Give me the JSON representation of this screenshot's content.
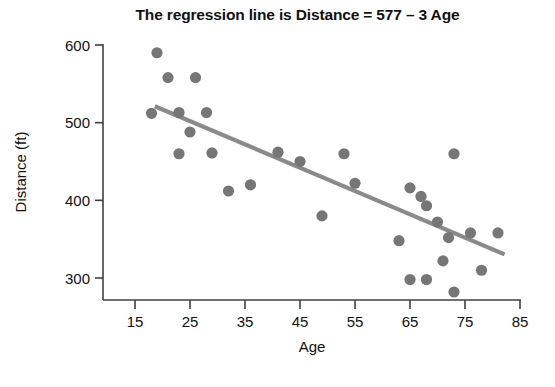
{
  "chart_data": {
    "type": "scatter",
    "title": "The regression line is Distance = 577 – 3 Age",
    "xlabel": "Age",
    "ylabel": "Distance (ft)",
    "xlim": [
      12,
      85
    ],
    "ylim": [
      270,
      610
    ],
    "xticks": [
      15,
      25,
      35,
      45,
      55,
      65,
      75,
      85
    ],
    "yticks": [
      300,
      400,
      500,
      600
    ],
    "grid": false,
    "legend": null,
    "point_color": "#767676",
    "line_color": "#8a8a8a",
    "axis_color": "#404040",
    "points": [
      {
        "x": 19,
        "y": 590
      },
      {
        "x": 21,
        "y": 558
      },
      {
        "x": 26,
        "y": 558
      },
      {
        "x": 18,
        "y": 512
      },
      {
        "x": 23,
        "y": 513
      },
      {
        "x": 28,
        "y": 513
      },
      {
        "x": 25,
        "y": 488
      },
      {
        "x": 23,
        "y": 460
      },
      {
        "x": 29,
        "y": 461
      },
      {
        "x": 32,
        "y": 412
      },
      {
        "x": 36,
        "y": 420
      },
      {
        "x": 41,
        "y": 462
      },
      {
        "x": 45,
        "y": 450
      },
      {
        "x": 49,
        "y": 380
      },
      {
        "x": 53,
        "y": 460
      },
      {
        "x": 55,
        "y": 422
      },
      {
        "x": 63,
        "y": 348
      },
      {
        "x": 65,
        "y": 416
      },
      {
        "x": 67,
        "y": 405
      },
      {
        "x": 68,
        "y": 393
      },
      {
        "x": 73,
        "y": 460
      },
      {
        "x": 70,
        "y": 372
      },
      {
        "x": 72,
        "y": 352
      },
      {
        "x": 76,
        "y": 358
      },
      {
        "x": 81,
        "y": 358
      },
      {
        "x": 71,
        "y": 322
      },
      {
        "x": 65,
        "y": 298
      },
      {
        "x": 68,
        "y": 298
      },
      {
        "x": 73,
        "y": 282
      },
      {
        "x": 78,
        "y": 310
      }
    ],
    "regression_line": {
      "equation": "Distance = 577 - 3 Age",
      "intercept": 577,
      "slope": -3,
      "x_start": 18.6,
      "x_end": 82.2
    }
  },
  "figure": {
    "title": "The regression line is Distance = 577 – 3 Age",
    "xlabel": "Age",
    "ylabel": "Distance (ft)",
    "xticks": [
      "15",
      "25",
      "35",
      "45",
      "55",
      "65",
      "75",
      "85"
    ],
    "yticks": [
      "300",
      "400",
      "500",
      "600"
    ]
  }
}
